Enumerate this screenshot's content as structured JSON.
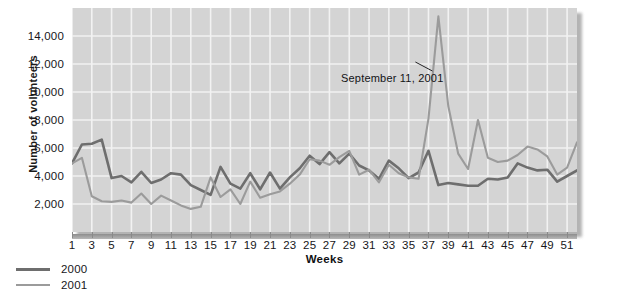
{
  "chart_data": {
    "type": "line",
    "title": "",
    "xlabel": "Weeks",
    "ylabel": "Number of volunteers",
    "xlim": [
      1,
      52
    ],
    "ylim": [
      0,
      16000
    ],
    "ytick_values": [
      2000,
      4000,
      6000,
      8000,
      10000,
      12000,
      14000
    ],
    "ytick_labels": [
      "2,000",
      "4,000",
      "6,000",
      "8,000",
      "10,000",
      "12,000",
      "14,000"
    ],
    "xtick_values": [
      1,
      3,
      5,
      7,
      9,
      11,
      13,
      15,
      17,
      19,
      21,
      23,
      25,
      27,
      29,
      31,
      33,
      35,
      37,
      39,
      41,
      43,
      45,
      47,
      49,
      51
    ],
    "xtick_labels": [
      "1",
      "3",
      "5",
      "7",
      "9",
      "11",
      "13",
      "15",
      "17",
      "19",
      "21",
      "23",
      "25",
      "27",
      "29",
      "31",
      "33",
      "35",
      "37",
      "39",
      "41",
      "43",
      "45",
      "47",
      "49",
      "51"
    ],
    "grid": true,
    "grid_color": "#f2f2f2",
    "plot_background": "#d4d4d4",
    "legend_position": "below-left",
    "x": [
      1,
      2,
      3,
      4,
      5,
      6,
      7,
      8,
      9,
      10,
      11,
      12,
      13,
      14,
      15,
      16,
      17,
      18,
      19,
      20,
      21,
      22,
      23,
      24,
      25,
      26,
      27,
      28,
      29,
      30,
      31,
      32,
      33,
      34,
      35,
      36,
      37,
      38,
      39,
      40,
      41,
      42,
      43,
      44,
      45,
      46,
      47,
      48,
      49,
      50,
      51,
      52
    ],
    "series": [
      {
        "name": "2000",
        "color": "#6e6e6e",
        "width": 2.6,
        "values": [
          4900,
          6250,
          6300,
          6600,
          3850,
          4000,
          3550,
          4300,
          3500,
          3750,
          4200,
          4100,
          3350,
          3000,
          2650,
          4650,
          3450,
          3100,
          4200,
          3050,
          4250,
          3100,
          3900,
          4550,
          5450,
          4850,
          5700,
          4900,
          5600,
          4750,
          4400,
          3800,
          5100,
          4550,
          3850,
          4250,
          5800,
          3350,
          3500,
          3400,
          3300,
          3300,
          3800,
          3750,
          3900,
          4900,
          4600,
          4400,
          4450,
          3600,
          4000,
          4400
        ]
      },
      {
        "name": "2001",
        "color": "#9b9b9b",
        "width": 2.1,
        "values": [
          4900,
          5300,
          2550,
          2200,
          2150,
          2250,
          2100,
          2750,
          2000,
          2600,
          2250,
          1900,
          1650,
          1800,
          3900,
          2500,
          3050,
          2000,
          3600,
          2450,
          2700,
          2900,
          3450,
          4100,
          5200,
          5100,
          4800,
          5350,
          5800,
          4100,
          4450,
          3550,
          4800,
          4200,
          3900,
          3800,
          8100,
          15400,
          9000,
          5600,
          4500,
          8000,
          5300,
          5000,
          5100,
          5500,
          6100,
          5900,
          5400,
          4100,
          4600,
          6400
        ]
      }
    ],
    "annotations": [
      {
        "text": "September 11, 2001",
        "target_x": 38,
        "target_y": 11500
      }
    ]
  }
}
